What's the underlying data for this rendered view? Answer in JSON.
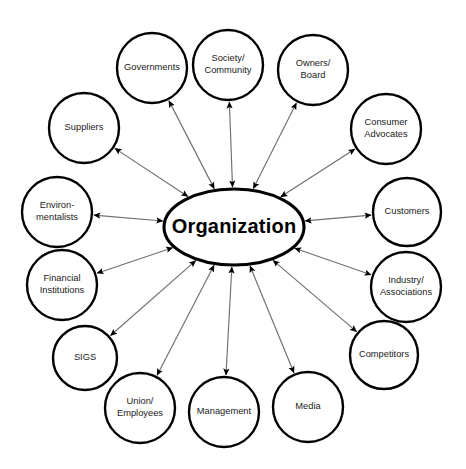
{
  "diagram": {
    "type": "radial-stakeholder-diagram",
    "canvas": {
      "width": 466,
      "height": 469,
      "background": "#ffffff"
    },
    "style": {
      "node_fill": "#ffffff",
      "node_stroke": "#000000",
      "edge_color": "#6f6f6f",
      "text_color": "#1a1a1a",
      "center_text_color": "#000000"
    },
    "center": {
      "label": "Organization",
      "shape": "ellipse",
      "cx": 234,
      "cy": 227,
      "rx": 70,
      "ry": 38
    },
    "edge_style": "bidirectional-arrow",
    "nodes": [
      {
        "id": "governments",
        "label": "Governments",
        "lines": [
          "Governments"
        ],
        "cx": 152,
        "cy": 68,
        "r": 35
      },
      {
        "id": "society",
        "label": "Society/ Community",
        "lines": [
          "Society/",
          "Community"
        ],
        "cx": 228,
        "cy": 65,
        "r": 35
      },
      {
        "id": "owners",
        "label": "Owners/ Board",
        "lines": [
          "Owners/",
          "Board"
        ],
        "cx": 313,
        "cy": 70,
        "r": 35
      },
      {
        "id": "consumer-advocates",
        "label": "Consumer Advocates",
        "lines": [
          "Consumer",
          "Advocates"
        ],
        "cx": 386,
        "cy": 129,
        "r": 35
      },
      {
        "id": "customers",
        "label": "Customers",
        "lines": [
          "Customers"
        ],
        "cx": 407,
        "cy": 212,
        "r": 34
      },
      {
        "id": "industry",
        "label": "Industry/ Associations",
        "lines": [
          "Industry/",
          "Associations"
        ],
        "cx": 406,
        "cy": 287,
        "r": 35
      },
      {
        "id": "competitors",
        "label": "Competitors",
        "lines": [
          "Competitors"
        ],
        "cx": 384,
        "cy": 355,
        "r": 34
      },
      {
        "id": "media",
        "label": "Media",
        "lines": [
          "Media"
        ],
        "cx": 308,
        "cy": 407,
        "r": 35
      },
      {
        "id": "management",
        "label": "Management",
        "lines": [
          "Management"
        ],
        "cx": 224,
        "cy": 412,
        "r": 35
      },
      {
        "id": "union",
        "label": "Union/ Employees",
        "lines": [
          "Union/",
          "Employees"
        ],
        "cx": 140,
        "cy": 408,
        "r": 35
      },
      {
        "id": "sigs",
        "label": "SIGS",
        "lines": [
          "SIGS"
        ],
        "cx": 85,
        "cy": 358,
        "r": 32
      },
      {
        "id": "financial",
        "label": "Financial Institutions",
        "lines": [
          "Financial",
          "Institutions"
        ],
        "cx": 62,
        "cy": 285,
        "r": 35
      },
      {
        "id": "environmentalists",
        "label": "Environ- mentalists",
        "lines": [
          "Environ-",
          "mentalists"
        ],
        "cx": 57,
        "cy": 212,
        "r": 35
      },
      {
        "id": "suppliers",
        "label": "Suppliers",
        "lines": [
          "Suppliers"
        ],
        "cx": 84,
        "cy": 128,
        "r": 35
      }
    ],
    "edges": [
      {
        "from": "organization",
        "to": "governments",
        "arrows": "both"
      },
      {
        "from": "organization",
        "to": "society",
        "arrows": "both"
      },
      {
        "from": "organization",
        "to": "owners",
        "arrows": "both"
      },
      {
        "from": "organization",
        "to": "consumer-advocates",
        "arrows": "both"
      },
      {
        "from": "organization",
        "to": "customers",
        "arrows": "both"
      },
      {
        "from": "organization",
        "to": "industry",
        "arrows": "both"
      },
      {
        "from": "organization",
        "to": "competitors",
        "arrows": "both"
      },
      {
        "from": "organization",
        "to": "media",
        "arrows": "both"
      },
      {
        "from": "organization",
        "to": "management",
        "arrows": "both"
      },
      {
        "from": "organization",
        "to": "union",
        "arrows": "both"
      },
      {
        "from": "organization",
        "to": "sigs",
        "arrows": "both"
      },
      {
        "from": "organization",
        "to": "financial",
        "arrows": "both"
      },
      {
        "from": "organization",
        "to": "environmentalists",
        "arrows": "both"
      },
      {
        "from": "organization",
        "to": "suppliers",
        "arrows": "both"
      }
    ]
  }
}
